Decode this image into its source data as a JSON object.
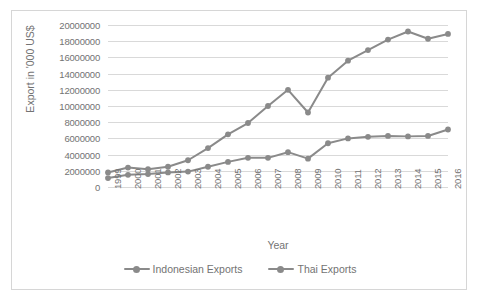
{
  "chart_data": {
    "type": "line",
    "title": "",
    "xlabel": "Year",
    "ylabel": "Export in '000 US$",
    "categories": [
      "1999",
      "2000",
      "2001",
      "2002",
      "2003",
      "2004",
      "2005",
      "2006",
      "2007",
      "2008",
      "2009",
      "2010",
      "2011",
      "2012",
      "2013",
      "2014",
      "2015",
      "2016"
    ],
    "ylim": [
      0,
      20000000
    ],
    "ytick_step": 2000000,
    "ytick_labels": [
      "20000000",
      "18000000",
      "16000000",
      "14000000",
      "12000000",
      "10000000",
      "8000000",
      "6000000",
      "4000000",
      "2000000",
      "0"
    ],
    "ytick_values": [
      20000000,
      18000000,
      16000000,
      14000000,
      12000000,
      10000000,
      8000000,
      6000000,
      4000000,
      2000000,
      0
    ],
    "grid": true,
    "legend_position": "bottom",
    "series": [
      {
        "name": "Indonesian Exports",
        "color": "#8a8a8a",
        "values": [
          1100000,
          1500000,
          1600000,
          1800000,
          1900000,
          2500000,
          3100000,
          3600000,
          3600000,
          4300000,
          3500000,
          5400000,
          6000000,
          6200000,
          6300000,
          6250000,
          6300000,
          7100000
        ]
      },
      {
        "name": "Thai Exports",
        "color": "#8a8a8a",
        "values": [
          1800000,
          2400000,
          2200000,
          2500000,
          3300000,
          4800000,
          6500000,
          7900000,
          10000000,
          12000000,
          9200000,
          13500000,
          15600000,
          16900000,
          18200000,
          19200000,
          18300000,
          18900000
        ]
      }
    ]
  },
  "legend": {
    "items": [
      {
        "label": "Indonesian Exports"
      },
      {
        "label": "Thai Exports"
      }
    ]
  },
  "axes": {
    "x_title": "Year",
    "y_title": "Export in '000 US$"
  },
  "colors": {
    "series_line": "#8a8a8a",
    "gridline": "#d9d9d9",
    "text": "#737373",
    "frame_border": "#d6d6d6",
    "background": "#ffffff"
  }
}
